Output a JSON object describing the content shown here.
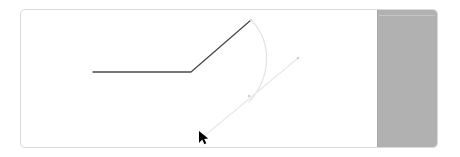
{
  "canvas": {
    "name": "drawing-canvas",
    "background_color": "#ffffff",
    "border_color": "#d9d9d9",
    "width": 418,
    "height": 139
  },
  "side_panel": {
    "name": "right-gray-panel",
    "fill_color": "#b1b1b1",
    "divider_color": "#c4c4c4",
    "width": 60
  },
  "shapes": {
    "polyline": {
      "name": "dark-polyline",
      "stroke_color": "#4a4a4a",
      "stroke_width": 1.3,
      "points": "72,62 170,62 230,10"
    },
    "curve": {
      "name": "light-curve",
      "stroke_color": "#e3e3e3",
      "stroke_width": 1.2,
      "path": "M 230,10 C 252,32 250,68 228,92"
    },
    "ray": {
      "name": "light-ray",
      "stroke_color": "#e8e8e8",
      "stroke_width": 1.2,
      "path": "M 181,128 L 277,48"
    },
    "handle_mid": {
      "name": "curve-midpoint-handle",
      "color": "#cfcfcf",
      "cx": 228,
      "cy": 86,
      "r": 1.3
    },
    "handle_end": {
      "name": "ray-endpoint-handle",
      "color": "#cfcfcf",
      "cx": 277,
      "cy": 48,
      "r": 1.3
    },
    "handle_apex": {
      "name": "polyline-apex-handle",
      "color": "#d5d5d5",
      "cx": 230,
      "cy": 10,
      "r": 1.2
    }
  },
  "cursor": {
    "name": "mouse-pointer",
    "color": "#000000",
    "x": 199,
    "y": 131
  }
}
